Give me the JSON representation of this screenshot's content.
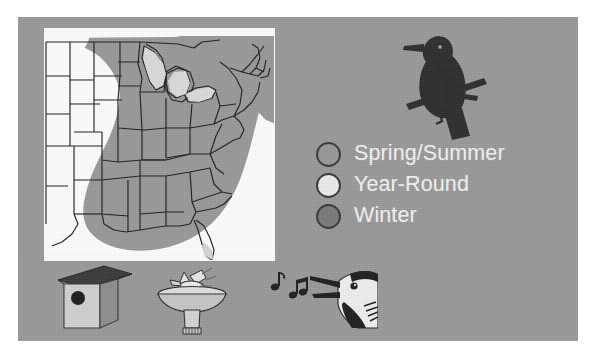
{
  "panel": {
    "background_color": "#9a9a9a",
    "border_color": "#ffffff"
  },
  "map": {
    "name": "range-map-eastern-united-states",
    "region": "Eastern United States",
    "background_color": "#ffffff",
    "range_fill_color": "#9a9a9a",
    "light_fill_color": "#d8d8d8",
    "outline_color": "#1f1f1f"
  },
  "bird_illustration": {
    "name": "perched-bird-silhouette",
    "color": "#2e2e2e",
    "description": "Bird perched on branch silhouette"
  },
  "legend": {
    "items": [
      {
        "label": "Spring/Summer",
        "color": "#9a9a9a",
        "swatch_name": "legend-swatch-spring-summer"
      },
      {
        "label": "Year-Round",
        "color": "#ededed",
        "swatch_name": "legend-swatch-year-round"
      },
      {
        "label": "Winter",
        "color": "#7a7a7a",
        "swatch_name": "legend-swatch-winter"
      }
    ],
    "text_color": "#f2f2f2"
  },
  "bottom_icons": [
    {
      "name": "birdhouse-icon",
      "label": "Birdhouse"
    },
    {
      "name": "birdbath-icon",
      "label": "Bird bath"
    },
    {
      "name": "birdsong-icon",
      "label": "Singing bird with music notes"
    }
  ]
}
